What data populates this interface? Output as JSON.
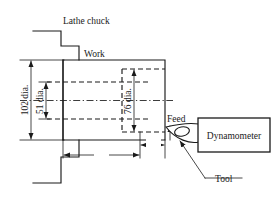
{
  "figure": {
    "kind": "engineering-diagram",
    "units_note": "mm"
  },
  "labels": {
    "lathe_chuck": "Lathe chuck",
    "work": "Work",
    "feed": "Feed",
    "tool": "Tool",
    "dynamometer": "Dynamometer"
  },
  "dimensions": {
    "outer_dia": "102 dia.",
    "bore_dia": "51 dia.",
    "step_dia": "76 dia.",
    "length_70": "70",
    "length_25": "25"
  },
  "colors": {
    "line": "#1a1a1a",
    "background": "#ffffff"
  }
}
